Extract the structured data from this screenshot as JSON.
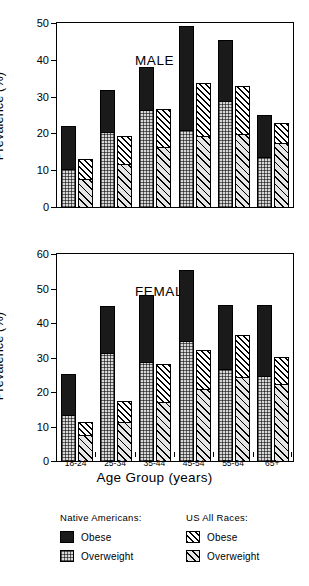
{
  "chart_data": {
    "type": "bar",
    "title": "",
    "xlabel": "Age Group (years)",
    "ylabel": "Prevalence (%)",
    "categories": [
      "18-24",
      "25-34",
      "35-44",
      "45-54",
      "55-64",
      "65+"
    ],
    "legend_position": "bottom",
    "grid": false,
    "panels": [
      {
        "name": "male",
        "label": "MALE",
        "ylim": [
          0,
          50
        ],
        "yticks": [
          0,
          10,
          20,
          30,
          40,
          50
        ],
        "series": [
          {
            "name": "Native Americans Overweight",
            "group": "Native Americans",
            "component": "Overweight",
            "values": [
              10.3,
              20.4,
              26.4,
              20.7,
              28.7,
              13.6
            ]
          },
          {
            "name": "Native Americans Obese",
            "group": "Native Americans",
            "component": "Obese",
            "values": [
              11.6,
              11.5,
              11.6,
              28.5,
              16.8,
              11.4
            ]
          },
          {
            "name": "Native Americans Total",
            "group": "Native Americans",
            "component": "Total",
            "values": [
              21.9,
              31.9,
              38.0,
              49.2,
              45.5,
              25.0
            ]
          },
          {
            "name": "US All Races Overweight",
            "group": "US All Races",
            "component": "Overweight",
            "values": [
              7.4,
              11.5,
              16.2,
              19.3,
              19.6,
              17.2
            ]
          },
          {
            "name": "US All Races Obese",
            "group": "US All Races",
            "component": "Obese",
            "values": [
              5.6,
              7.9,
              10.4,
              14.3,
              13.2,
              5.5
            ]
          },
          {
            "name": "US All Races Total",
            "group": "US All Races",
            "component": "Total",
            "values": [
              13.0,
              19.4,
              26.6,
              33.6,
              32.8,
              22.7
            ]
          }
        ]
      },
      {
        "name": "female",
        "label": "FEMALE",
        "ylim": [
          0,
          60
        ],
        "yticks": [
          0,
          10,
          20,
          30,
          40,
          50,
          60
        ],
        "series": [
          {
            "name": "Native Americans Overweight",
            "group": "Native Americans",
            "component": "Overweight",
            "values": [
              13.2,
              31.1,
              28.6,
              34.8,
              26.5,
              24.4
            ]
          },
          {
            "name": "Native Americans Obese",
            "group": "Native Americans",
            "component": "Obese",
            "values": [
              11.9,
              13.8,
              19.6,
              20.6,
              18.8,
              20.9
            ]
          },
          {
            "name": "Native Americans Total",
            "group": "Native Americans",
            "component": "Total",
            "values": [
              25.1,
              44.9,
              48.2,
              55.4,
              45.3,
              45.3
            ]
          },
          {
            "name": "US All Races Overweight",
            "group": "US All Races",
            "component": "Overweight",
            "values": [
              7.5,
              11.1,
              17.0,
              20.7,
              24.4,
              22.2
            ]
          },
          {
            "name": "US All Races Obese",
            "group": "US All Races",
            "component": "Obese",
            "values": [
              3.9,
              6.3,
              11.2,
              11.4,
              12.1,
              7.9
            ]
          },
          {
            "name": "US All Races Total",
            "group": "US All Races",
            "component": "Total",
            "values": [
              11.4,
              17.4,
              28.2,
              32.1,
              36.5,
              30.1
            ]
          }
        ]
      }
    ],
    "legend": {
      "columns": [
        {
          "heading": "Native Americans:",
          "entries": [
            {
              "label": "Obese",
              "swatch": "na-obese"
            },
            {
              "label": "Overweight",
              "swatch": "na-over"
            }
          ]
        },
        {
          "heading": "US All Races:",
          "entries": [
            {
              "label": "Obese",
              "swatch": "us-obese"
            },
            {
              "label": "Overweight",
              "swatch": "us-over"
            }
          ]
        }
      ]
    }
  }
}
